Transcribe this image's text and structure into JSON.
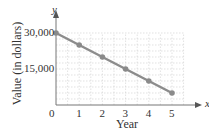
{
  "chart_data": {
    "type": "line",
    "title": "",
    "xlabel": "Year",
    "ylabel": "Value (in dollars)",
    "x_axis_var": "x",
    "y_axis_var": "y",
    "x": [
      0,
      1,
      2,
      3,
      4,
      5
    ],
    "series": [
      {
        "name": "Value",
        "values": [
          30000,
          25000,
          20000,
          15000,
          10000,
          5000
        ],
        "color": "#8c8c8c"
      }
    ],
    "x_ticks": [
      "0",
      "1",
      "2",
      "3",
      "4",
      "5"
    ],
    "y_ticks": [
      "15,000",
      "30,000"
    ],
    "xlim": [
      0,
      5.5
    ],
    "ylim": [
      0,
      30000
    ],
    "grid": true
  }
}
